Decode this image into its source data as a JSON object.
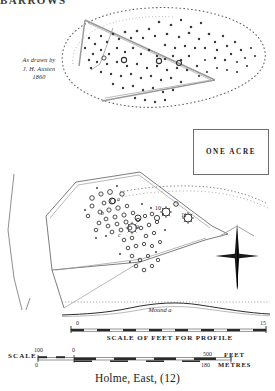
{
  "header": {
    "clipped_text": "BARROWS"
  },
  "upper_plan": {
    "attribution": {
      "line1": "As drawn by",
      "line2": "J. H. Austen",
      "line3": "1860"
    }
  },
  "one_acre": {
    "label": "ONE ACRE"
  },
  "lower_plan": {
    "labels": [
      {
        "text": "a",
        "x": 118,
        "y": 200
      },
      {
        "text": "b",
        "x": 102,
        "y": 214
      },
      {
        "text": "c",
        "x": 119,
        "y": 235
      },
      {
        "text": "9",
        "x": 136,
        "y": 228
      },
      {
        "text": "10",
        "x": 157,
        "y": 210
      },
      {
        "text": "11",
        "x": 180,
        "y": 216
      }
    ],
    "compass": "north-arrow"
  },
  "profile": {
    "mound_label": "Mound a",
    "scale_title": "SCALE OF FEET FOR PROFILE",
    "tick_left": "0",
    "tick_right": "15"
  },
  "scale": {
    "word": "SCALE",
    "feet_start": "100",
    "feet_zero": "0",
    "feet_end": "500",
    "feet_unit": "FEET",
    "metres_zero": "0",
    "metres_end": "180",
    "metres_unit": "METRES"
  },
  "figure": {
    "title": "Holme, East, (12)"
  },
  "colors": {
    "ink": "#1a1a1a",
    "line": "#6d6d6d",
    "gray_line": "#9a9a9a",
    "paper": "#ffffff"
  }
}
